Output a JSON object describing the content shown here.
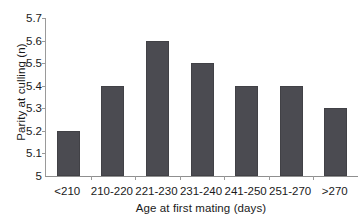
{
  "chart_data": {
    "type": "bar",
    "title": "",
    "subtitle": "",
    "categories": [
      "<210",
      "210-220",
      "221-230",
      "231-240",
      "241-250",
      "251-270",
      ">270"
    ],
    "values": [
      5.2,
      5.4,
      5.6,
      5.5,
      5.4,
      5.4,
      5.3
    ],
    "xlabel": "Age at first mating (days)",
    "ylabel": "Parity at culling (n)",
    "ylim": [
      5,
      5.7
    ],
    "ytick_labels": [
      "5.7",
      "5.6",
      "5.5",
      "5.4",
      "5.3",
      "5.2",
      "5.1",
      "5"
    ],
    "ytick_values": [
      5.7,
      5.6,
      5.5,
      5.4,
      5.3,
      5.2,
      5.1,
      5.0
    ],
    "grid": false,
    "legend": null,
    "legend_position": "none",
    "annotations": [],
    "bar_color": "#4b4b51",
    "axis_color": "#9a9a9a",
    "background_color": "#ffffff"
  }
}
